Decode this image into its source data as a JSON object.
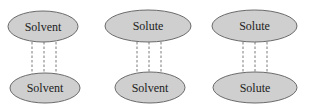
{
  "diagram": {
    "groups": [
      {
        "top": "Solvent",
        "bottom": "Solvent"
      },
      {
        "top": "Solute",
        "bottom": "Solvent"
      },
      {
        "top": "Solute",
        "bottom": "Solute"
      }
    ],
    "colors": {
      "fill": "#cfcfcf",
      "stroke": "#6a6a6a",
      "connector": "#7a7a7a"
    }
  }
}
